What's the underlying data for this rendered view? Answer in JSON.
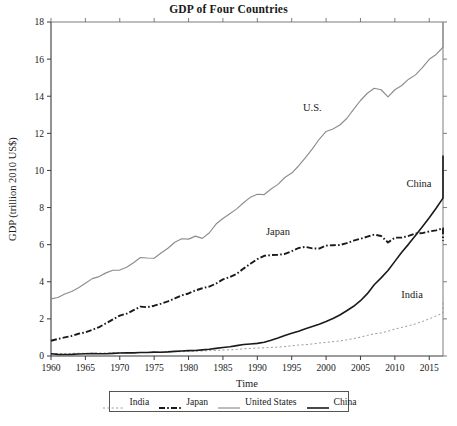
{
  "chart_data": {
    "type": "line",
    "title": "GDP of Four Countries",
    "xlabel": "Time",
    "ylabel": "GDP (trillion 2010 US$)",
    "xlim": [
      1960,
      2017
    ],
    "ylim": [
      0,
      18
    ],
    "xticks": [
      1960,
      1965,
      1970,
      1975,
      1980,
      1985,
      1990,
      1995,
      2000,
      2005,
      2010,
      2015
    ],
    "yticks": [
      0,
      2,
      4,
      6,
      8,
      10,
      12,
      14,
      16,
      18
    ],
    "grid": false,
    "legend_position": "below-axes",
    "x": [
      1960,
      1961,
      1962,
      1963,
      1964,
      1965,
      1966,
      1967,
      1968,
      1969,
      1970,
      1971,
      1972,
      1973,
      1974,
      1975,
      1976,
      1977,
      1978,
      1979,
      1980,
      1981,
      1982,
      1983,
      1984,
      1985,
      1986,
      1987,
      1988,
      1989,
      1990,
      1991,
      1992,
      1993,
      1994,
      1995,
      1996,
      1997,
      1998,
      1999,
      2000,
      2001,
      2002,
      2003,
      2004,
      2005,
      2006,
      2007,
      2008,
      2009,
      2010,
      2011,
      2012,
      2013,
      2014,
      2015,
      2016,
      2017
    ],
    "series": [
      {
        "name": "India",
        "style": "dotted",
        "color": "#9a9a9a",
        "values": [
          0.12,
          0.13,
          0.13,
          0.14,
          0.15,
          0.14,
          0.15,
          0.16,
          0.16,
          0.17,
          0.18,
          0.18,
          0.18,
          0.19,
          0.19,
          0.21,
          0.21,
          0.23,
          0.24,
          0.23,
          0.25,
          0.26,
          0.27,
          0.29,
          0.3,
          0.32,
          0.33,
          0.35,
          0.39,
          0.41,
          0.43,
          0.44,
          0.46,
          0.48,
          0.51,
          0.55,
          0.59,
          0.61,
          0.65,
          0.7,
          0.73,
          0.77,
          0.81,
          0.87,
          0.94,
          1.02,
          1.11,
          1.2,
          1.24,
          1.34,
          1.45,
          1.54,
          1.63,
          1.73,
          1.86,
          2.0,
          2.16,
          2.32
        ],
        "endpoint_value": 2.9
      },
      {
        "name": "Japan",
        "style": "dash-dot",
        "color": "#1a1a1a",
        "values": [
          0.82,
          0.92,
          1.0,
          1.08,
          1.2,
          1.27,
          1.41,
          1.56,
          1.76,
          1.97,
          2.18,
          2.28,
          2.47,
          2.66,
          2.63,
          2.71,
          2.82,
          2.94,
          3.1,
          3.27,
          3.37,
          3.53,
          3.65,
          3.74,
          3.9,
          4.13,
          4.25,
          4.43,
          4.71,
          4.97,
          5.22,
          5.4,
          5.44,
          5.45,
          5.5,
          5.65,
          5.82,
          5.88,
          5.8,
          5.79,
          5.95,
          5.97,
          5.98,
          6.08,
          6.22,
          6.32,
          6.43,
          6.54,
          6.47,
          6.12,
          6.38,
          6.38,
          6.47,
          6.6,
          6.62,
          6.71,
          6.77,
          6.88
        ],
        "endpoint_value": 6.2
      },
      {
        "name": "United States",
        "style": "solid-light",
        "color": "#8d8d8d",
        "values": [
          3.08,
          3.15,
          3.34,
          3.48,
          3.68,
          3.92,
          4.17,
          4.28,
          4.48,
          4.62,
          4.63,
          4.78,
          5.03,
          5.31,
          5.28,
          5.27,
          5.55,
          5.81,
          6.13,
          6.32,
          6.3,
          6.46,
          6.34,
          6.63,
          7.11,
          7.41,
          7.67,
          7.93,
          8.26,
          8.56,
          8.72,
          8.7,
          9.0,
          9.25,
          9.62,
          9.86,
          10.24,
          10.69,
          11.16,
          11.68,
          12.1,
          12.23,
          12.45,
          12.8,
          13.29,
          13.77,
          14.16,
          14.43,
          14.35,
          13.96,
          14.35,
          14.58,
          14.92,
          15.15,
          15.54,
          15.99,
          16.25,
          16.64
        ],
        "endpoint_value": 18.0
      },
      {
        "name": "China",
        "style": "solid-dark",
        "color": "#1a1a1a",
        "values": [
          0.12,
          0.09,
          0.08,
          0.09,
          0.11,
          0.12,
          0.13,
          0.12,
          0.12,
          0.14,
          0.16,
          0.17,
          0.17,
          0.19,
          0.19,
          0.21,
          0.2,
          0.22,
          0.25,
          0.27,
          0.29,
          0.3,
          0.33,
          0.36,
          0.41,
          0.46,
          0.5,
          0.56,
          0.62,
          0.65,
          0.68,
          0.74,
          0.85,
          0.97,
          1.1,
          1.22,
          1.34,
          1.47,
          1.59,
          1.71,
          1.86,
          2.02,
          2.21,
          2.44,
          2.68,
          2.98,
          3.36,
          3.84,
          4.21,
          4.61,
          5.1,
          5.59,
          6.03,
          6.5,
          6.97,
          7.45,
          7.96,
          8.51
        ],
        "endpoint_value": 10.8
      }
    ],
    "annotations": [
      {
        "text": "U.S.",
        "x": 1998,
        "y": 13.2
      },
      {
        "text": "China",
        "x": 2013.5,
        "y": 9.1
      },
      {
        "text": "Japan",
        "x": 1993,
        "y": 6.5
      },
      {
        "text": "India",
        "x": 2012.5,
        "y": 3.15
      }
    ]
  },
  "legend": {
    "items": [
      {
        "label": "India",
        "style": "dotted"
      },
      {
        "label": "Japan",
        "style": "dash-dot"
      },
      {
        "label": "United States",
        "style": "solid-light"
      },
      {
        "label": "China",
        "style": "solid-dark"
      }
    ]
  }
}
